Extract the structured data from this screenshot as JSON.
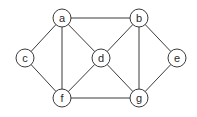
{
  "graph": {
    "nodes": [
      {
        "id": "a",
        "label": "a",
        "x": 62,
        "y": 18
      },
      {
        "id": "b",
        "label": "b",
        "x": 139,
        "y": 18
      },
      {
        "id": "c",
        "label": "c",
        "x": 25,
        "y": 58
      },
      {
        "id": "d",
        "label": "d",
        "x": 101,
        "y": 58
      },
      {
        "id": "e",
        "label": "e",
        "x": 177,
        "y": 58
      },
      {
        "id": "f",
        "label": "f",
        "x": 62,
        "y": 98
      },
      {
        "id": "g",
        "label": "g",
        "x": 139,
        "y": 98
      }
    ],
    "edges": [
      [
        "a",
        "b"
      ],
      [
        "a",
        "c"
      ],
      [
        "a",
        "d"
      ],
      [
        "a",
        "f"
      ],
      [
        "c",
        "f"
      ],
      [
        "d",
        "f"
      ],
      [
        "b",
        "d"
      ],
      [
        "d",
        "g"
      ],
      [
        "b",
        "g"
      ],
      [
        "b",
        "e"
      ],
      [
        "e",
        "g"
      ],
      [
        "f",
        "g"
      ]
    ],
    "node_radius": 9,
    "colors": {
      "stroke": "#3a3a3a",
      "fill": "#ffffff",
      "text": "#2a2a2a"
    }
  }
}
